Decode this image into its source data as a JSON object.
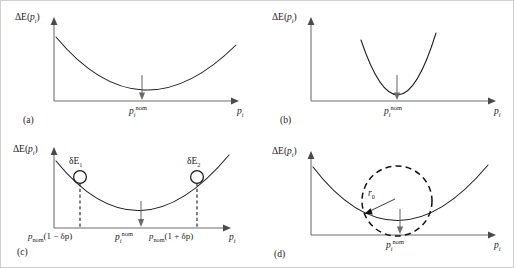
{
  "figure": {
    "type": "multi-panel-diagram",
    "panel_count": 4,
    "background": "#ffffff",
    "curve_color": "#1a1a1a",
    "axis_color": "#6f6f6f",
    "arrow_color": "#6a6a6a"
  },
  "axis_labels": {
    "y_delta": "ΔE(",
    "y_var": "p",
    "y_sub": "i",
    "y_close": ")",
    "x_var": "p",
    "x_sub": "i"
  },
  "panels": [
    {
      "id": "a",
      "letter": "(a)",
      "ylabel_main": "ΔE(",
      "ylabel_var": "p",
      "ylabel_sub": "i",
      "ylabel_close": ")",
      "xlabel_var": "p",
      "xlabel_sub": "i",
      "nominal_var": "p",
      "nominal_sub": "i",
      "nominal_sup": "nom",
      "description": "wide shallow parabola, flat minimum at nominal point"
    },
    {
      "id": "b",
      "letter": "(b)",
      "ylabel_main": "ΔE(",
      "ylabel_var": "p",
      "ylabel_sub": "i",
      "ylabel_close": ")",
      "xlabel_var": "p",
      "xlabel_sub": "i",
      "nominal_var": "p",
      "nominal_sub": "i",
      "nominal_sup": "nom",
      "description": "narrow steep parabola, sharp minimum at nominal point"
    },
    {
      "id": "c",
      "letter": "(c)",
      "ylabel_main": "ΔE(",
      "ylabel_var": "p",
      "ylabel_sub": "i",
      "ylabel_close": ")",
      "xlabel_var": "p",
      "xlabel_sub": "i",
      "nominal_var": "p",
      "nominal_sub": "i",
      "nominal_sup": "nom",
      "left_tick_var": "p",
      "left_tick_sub": "nom",
      "left_tick_expr": "(1 − δp)",
      "right_tick_var": "p",
      "right_tick_sub": "nom",
      "right_tick_expr": "(1 + δp)",
      "marker1_delta": "δE",
      "marker1_sub": "1",
      "marker2_delta": "δE",
      "marker2_sub": "2",
      "description": "parabola with two sampled points at +/- delta p showing energy deviations"
    },
    {
      "id": "d",
      "letter": "(d)",
      "ylabel_main": "ΔE(",
      "ylabel_var": "p",
      "ylabel_sub": "i",
      "ylabel_close": ")",
      "xlabel_var": "p",
      "xlabel_sub": "i",
      "nominal_var": "p",
      "nominal_sub": "i",
      "nominal_sup": "nom",
      "radius_var": "r",
      "radius_sub": "0",
      "description": "parabola with dashed osculating circle of curvature radius at the minimum"
    }
  ]
}
